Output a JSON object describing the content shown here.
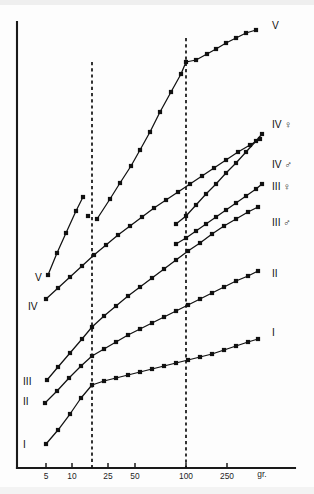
{
  "chart_data": {
    "type": "line",
    "title": "",
    "subtitle": "",
    "xlabel": "gr.",
    "ylabel": "",
    "xscale": "log",
    "grid": false,
    "legend_position": "inline-right",
    "x_tick_labels": [
      "5",
      "10",
      "25",
      "50",
      "100",
      "250"
    ],
    "x_tick_values": [
      5,
      10,
      25,
      50,
      100,
      250
    ],
    "x_tick_px": [
      46,
      72,
      108,
      135,
      186,
      227
    ],
    "xlim_px": [
      17,
      295
    ],
    "ylim_px": [
      22,
      468
    ],
    "unit_label": "gr.",
    "unit_label_px": [
      262,
      477
    ],
    "reference_lines": [
      {
        "name": "dashed-ref-left",
        "x_px": 92,
        "y_top_px": 62,
        "y_bottom_px": 468,
        "style": "dashed"
      },
      {
        "name": "dashed-ref-right",
        "x_px": 186,
        "y_top_px": 38,
        "y_bottom_px": 468,
        "style": "dashed"
      }
    ],
    "series": [
      {
        "name": "V",
        "label_right": "V",
        "label_left": "V",
        "label_right_px": [
          272,
          29
        ],
        "label_left_px": [
          35,
          281
        ],
        "segments": [
          {
            "points_px": [
              [
                48,
                275
              ],
              [
                57,
                253
              ],
              [
                66,
                233
              ],
              [
                76,
                211
              ],
              [
                83,
                197
              ]
            ]
          },
          {
            "points_px": [
              [
                97,
                219
              ],
              [
                110,
                199
              ],
              [
                120,
                183
              ],
              [
                131,
                166
              ],
              [
                140,
                150
              ],
              [
                150,
                132
              ],
              [
                160,
                112
              ],
              [
                171,
                92
              ],
              [
                181,
                74
              ],
              [
                186,
                62
              ],
              [
                196,
                60
              ],
              [
                207,
                54
              ],
              [
                216,
                49
              ],
              [
                226,
                43
              ],
              [
                236,
                38
              ],
              [
                246,
                33
              ],
              [
                256,
                30
              ]
            ]
          }
        ],
        "isolated_points_px": [
          [
            88,
            216
          ]
        ]
      },
      {
        "name": "IV-female",
        "label_right": "IV ♀",
        "label_right_px": [
          272,
          128
        ],
        "segments": [
          {
            "points_px": [
              [
                176,
                224
              ],
              [
                186,
                216
              ],
              [
                196,
                205
              ],
              [
                206,
                194
              ],
              [
                216,
                184
              ],
              [
                226,
                173
              ],
              [
                236,
                163
              ],
              [
                246,
                152
              ],
              [
                256,
                141
              ],
              [
                262,
                134
              ]
            ]
          }
        ],
        "isolated_points_px": []
      },
      {
        "name": "IV-male",
        "label_right": "IV ♂",
        "label_left": "IV",
        "label_right_px": [
          272,
          168
        ],
        "label_left_px": [
          28,
          310
        ],
        "segments": [
          {
            "points_px": [
              [
                46,
                299
              ],
              [
                58,
                288
              ],
              [
                70,
                277
              ],
              [
                82,
                266
              ],
              [
                94,
                255
              ],
              [
                106,
                245
              ],
              [
                118,
                235
              ],
              [
                130,
                226
              ],
              [
                142,
                217
              ],
              [
                154,
                208
              ],
              [
                166,
                200
              ],
              [
                178,
                192
              ],
              [
                190,
                184
              ],
              [
                202,
                176
              ],
              [
                214,
                168
              ],
              [
                226,
                160
              ],
              [
                238,
                152
              ],
              [
                250,
                145
              ],
              [
                260,
                139
              ]
            ]
          }
        ],
        "isolated_points_px": []
      },
      {
        "name": "III-female",
        "label_right": "III ♀",
        "label_right_px": [
          272,
          190
        ],
        "segments": [
          {
            "points_px": [
              [
                176,
                244
              ],
              [
                186,
                238
              ],
              [
                196,
                231
              ],
              [
                206,
                224
              ],
              [
                216,
                217
              ],
              [
                226,
                210
              ],
              [
                236,
                203
              ],
              [
                246,
                196
              ],
              [
                256,
                189
              ],
              [
                262,
                184
              ]
            ]
          }
        ],
        "isolated_points_px": []
      },
      {
        "name": "III-male",
        "label_right": "III ♂",
        "label_left": "III",
        "label_right_px": [
          272,
          226
        ],
        "label_left_px": [
          23,
          385
        ],
        "segments": [
          {
            "points_px": [
              [
                47,
                380
              ],
              [
                58,
                367
              ],
              [
                70,
                353
              ],
              [
                82,
                339
              ],
              [
                92,
                327
              ],
              [
                104,
                316
              ],
              [
                116,
                306
              ],
              [
                128,
                296
              ],
              [
                140,
                287
              ],
              [
                152,
                278
              ],
              [
                164,
                269
              ],
              [
                176,
                260
              ],
              [
                188,
                251
              ],
              [
                200,
                243
              ],
              [
                212,
                234
              ],
              [
                224,
                226
              ],
              [
                236,
                219
              ],
              [
                248,
                212
              ],
              [
                258,
                207
              ]
            ]
          }
        ],
        "isolated_points_px": []
      },
      {
        "name": "II",
        "label_right": "II",
        "label_left": "II",
        "label_right_px": [
          272,
          277
        ],
        "label_left_px": [
          23,
          405
        ],
        "segments": [
          {
            "points_px": [
              [
                45,
                403
              ],
              [
                57,
                391
              ],
              [
                69,
                378
              ],
              [
                81,
                366
              ],
              [
                92,
                356
              ],
              [
                104,
                349
              ],
              [
                116,
                342
              ],
              [
                128,
                335
              ],
              [
                140,
                329
              ],
              [
                152,
                323
              ],
              [
                164,
                317
              ],
              [
                176,
                311
              ],
              [
                188,
                305
              ],
              [
                200,
                299
              ],
              [
                212,
                293
              ],
              [
                224,
                287
              ],
              [
                236,
                281
              ],
              [
                248,
                276
              ],
              [
                258,
                271
              ]
            ]
          }
        ],
        "isolated_points_px": []
      },
      {
        "name": "I",
        "label_right": "I",
        "label_left": "I",
        "label_right_px": [
          272,
          336
        ],
        "label_left_px": [
          23,
          448
        ],
        "segments": [
          {
            "points_px": [
              [
                46,
                444
              ],
              [
                58,
                430
              ],
              [
                70,
                414
              ],
              [
                81,
                398
              ],
              [
                92,
                385
              ],
              [
                104,
                381
              ],
              [
                116,
                378
              ],
              [
                128,
                375
              ],
              [
                140,
                372
              ],
              [
                152,
                369
              ],
              [
                164,
                366
              ],
              [
                176,
                363
              ],
              [
                188,
                360
              ],
              [
                200,
                357
              ],
              [
                212,
                354
              ],
              [
                224,
                350
              ],
              [
                236,
                346
              ],
              [
                248,
                342
              ],
              [
                258,
                339
              ]
            ]
          }
        ],
        "isolated_points_px": []
      }
    ]
  }
}
